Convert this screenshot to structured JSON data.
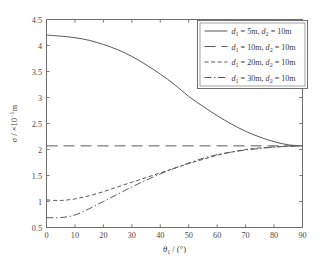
{
  "chart_data": {
    "type": "line",
    "title": "",
    "xlabel": "θ₁ / (°)",
    "ylabel": "σ / ×10⁻¹m",
    "xlim": [
      0,
      90
    ],
    "ylim": [
      0.5,
      4.5
    ],
    "xticks": [
      0,
      10,
      20,
      30,
      40,
      50,
      60,
      70,
      80,
      90
    ],
    "yticks": [
      0.5,
      1,
      1.5,
      2,
      2.5,
      3,
      3.5,
      4,
      4.5
    ],
    "xticklabels": [
      "0",
      "10",
      "20",
      "30",
      "40",
      "50",
      "60",
      "70",
      "80",
      "90"
    ],
    "yticklabels": [
      "0.5",
      "1",
      "1.5",
      "2",
      "2.5",
      "3",
      "3.5",
      "4",
      "4.5"
    ],
    "grid": false,
    "legend_position": "upper-right",
    "x": [
      0,
      5,
      10,
      15,
      20,
      25,
      30,
      35,
      40,
      45,
      50,
      55,
      60,
      65,
      70,
      75,
      80,
      85,
      90
    ],
    "series": [
      {
        "name": "d1 = 5m, d2 = 10m",
        "style": "solid",
        "values": [
          4.2,
          4.18,
          4.15,
          4.1,
          4.02,
          3.92,
          3.79,
          3.63,
          3.45,
          3.25,
          3.02,
          2.83,
          2.65,
          2.49,
          2.35,
          2.24,
          2.15,
          2.09,
          2.07
        ]
      },
      {
        "name": "d1 = 10m, d2 = 10m",
        "style": "dashed",
        "values": [
          2.07,
          2.07,
          2.07,
          2.07,
          2.07,
          2.07,
          2.07,
          2.07,
          2.07,
          2.07,
          2.07,
          2.07,
          2.07,
          2.07,
          2.07,
          2.07,
          2.07,
          2.07,
          2.07
        ]
      },
      {
        "name": "d1 = 20m, d2 = 10m",
        "style": "shortdash",
        "values": [
          1.03,
          1.02,
          1.05,
          1.11,
          1.19,
          1.28,
          1.37,
          1.46,
          1.55,
          1.64,
          1.73,
          1.81,
          1.89,
          1.95,
          2.0,
          2.03,
          2.05,
          2.065,
          2.07
        ]
      },
      {
        "name": "d1 = 30m, d2 = 10m",
        "style": "dashdot",
        "values": [
          0.69,
          0.69,
          0.74,
          0.86,
          1.0,
          1.14,
          1.28,
          1.41,
          1.53,
          1.64,
          1.74,
          1.83,
          1.9,
          1.95,
          1.99,
          2.02,
          2.045,
          2.062,
          2.07
        ]
      }
    ]
  },
  "legend": {
    "entries": [
      {
        "d1_label": "d",
        "d1_sub": "1",
        "d1_val": " = 5m, ",
        "d2_label": "d",
        "d2_sub": "2",
        "d2_val": " = 10m",
        "style": "solid"
      },
      {
        "d1_label": "d",
        "d1_sub": "1",
        "d1_val": " = 10m, ",
        "d2_label": "d",
        "d2_sub": "2",
        "d2_val": " = 10m",
        "style": "dashed"
      },
      {
        "d1_label": "d",
        "d1_sub": "1",
        "d1_val": " = 20m, ",
        "d2_label": "d",
        "d2_sub": "2",
        "d2_val": " = 10m",
        "style": "shortdash"
      },
      {
        "d1_label": "d",
        "d1_sub": "1",
        "d1_val": " = 30m, ",
        "d2_label": "d",
        "d2_sub": "2",
        "d2_val": " = 10m",
        "style": "dashdot"
      }
    ]
  },
  "axis_titles": {
    "x_sigma": "θ",
    "x_sub": "1",
    "x_rest": " / (°)",
    "y_sigma": "σ",
    "y_rest": " / ×10",
    "y_exp": "−1",
    "y_unit": "m"
  },
  "colors": {
    "line": "#595959",
    "axis": "#6e6e6e",
    "text": "#3a3a3a",
    "background": "#ffffff"
  }
}
